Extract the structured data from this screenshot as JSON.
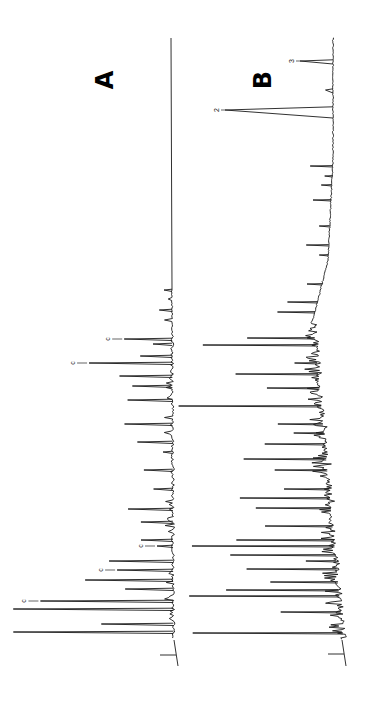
{
  "figure": {
    "panel_a_label": "A",
    "panel_b_label": "B",
    "orientation": "rotated 90° counter-clockwise: retention time runs bottom-to-top, detector response extends leftward"
  },
  "chart_data": [
    {
      "type": "line",
      "title": "A",
      "xlabel": "",
      "ylabel": "",
      "grid": false,
      "description": "Gas chromatogram trace A; flat baseline in late-eluting region, dense sharp peaks in early region, several marked 'c'",
      "baseline_x_px": 172,
      "time_axis_px": [
        638,
        118
      ],
      "annotations": [
        {
          "label": "c",
          "peak_y_px": 601,
          "height_frac": 0.83
        },
        {
          "label": "c",
          "peak_y_px": 570,
          "height_frac": 0.35
        },
        {
          "label": "c",
          "peak_y_px": 546,
          "height_frac": 0.1
        },
        {
          "label": "c",
          "peak_y_px": 363,
          "height_frac": 0.52
        },
        {
          "label": "c",
          "peak_y_px": 339,
          "height_frac": 0.3
        }
      ],
      "peaks_y_px": [
        632,
        624,
        609,
        601,
        589,
        580,
        570,
        561,
        546,
        540,
        522,
        509,
        489,
        470,
        452,
        442,
        424,
        400,
        386,
        376,
        363,
        356,
        344,
        339,
        310,
        290
      ],
      "peaks_height_frac": [
        1.0,
        0.45,
        1.0,
        0.83,
        0.3,
        0.55,
        0.35,
        0.4,
        0.1,
        0.2,
        0.2,
        0.28,
        0.12,
        0.18,
        0.06,
        0.22,
        0.3,
        0.28,
        0.25,
        0.33,
        0.52,
        0.2,
        0.12,
        0.3,
        0.08,
        0.05
      ]
    },
    {
      "type": "line",
      "title": "B",
      "xlabel": "",
      "ylabel": "",
      "grid": false,
      "description": "Gas chromatogram trace B; drifting baseline with very dense peak cluster in early region, broader late peaks labelled 2 and 3",
      "baseline_x_px_range": [
        345,
        330
      ],
      "time_axis_px": [
        640,
        38
      ],
      "annotations": [
        {
          "label": "2",
          "peak_y_px": 110,
          "height_frac": 0.72
        },
        {
          "label": "3",
          "peak_y_px": 61,
          "height_frac": 0.22
        }
      ],
      "peaks_y_px": [
        633,
        612,
        596,
        590,
        582,
        569,
        561,
        555,
        546,
        540,
        526,
        508,
        498,
        489,
        470,
        459,
        444,
        433,
        424,
        406,
        388,
        374,
        363,
        345,
        338,
        312,
        302,
        284,
        255,
        245,
        226,
        200,
        185,
        176,
        166,
        110,
        90,
        61
      ],
      "peaks_height_frac": [
        1.0,
        0.4,
        1.0,
        0.75,
        0.45,
        0.6,
        0.2,
        0.7,
        0.95,
        0.65,
        0.45,
        0.5,
        0.6,
        0.3,
        0.35,
        0.55,
        0.4,
        0.2,
        0.3,
        0.95,
        0.35,
        0.55,
        0.15,
        0.75,
        0.45,
        0.25,
        0.2,
        0.1,
        0.06,
        0.15,
        0.07,
        0.12,
        0.07,
        0.05,
        0.15,
        0.72,
        0.05,
        0.22
      ]
    }
  ]
}
